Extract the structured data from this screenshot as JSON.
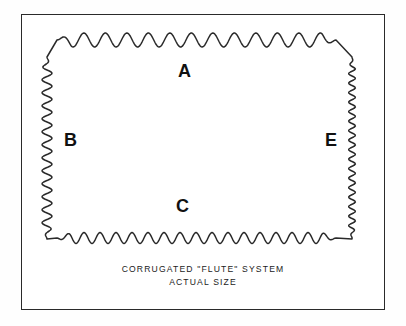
{
  "figure": {
    "stroke_color": "#2a2a2a",
    "background_color": "#ffffff",
    "frame": {
      "x": 21,
      "y": 14,
      "width": 364,
      "height": 296,
      "border_color": "#2a2a2a",
      "border_width_px": 1.4
    },
    "labels": [
      {
        "id": "A",
        "text": "A",
        "edge": "top",
        "flute": "A-flute",
        "x": 178,
        "y": 62
      },
      {
        "id": "B",
        "text": "B",
        "edge": "left",
        "flute": "B-flute",
        "x": 64,
        "y": 131
      },
      {
        "id": "C",
        "text": "C",
        "edge": "bottom",
        "flute": "C-flute",
        "x": 176,
        "y": 197
      },
      {
        "id": "E",
        "text": "E",
        "edge": "right",
        "flute": "E-flute",
        "x": 325,
        "y": 131
      }
    ],
    "caption": {
      "line1": "CORRUGATED \"FLUTE\" SYSTEM",
      "line2": "ACTUAL SIZE"
    }
  },
  "chart_data": {
    "type": "line",
    "title": "CORRUGATED \"FLUTE\" SYSTEM",
    "subtitle": "ACTUAL SIZE",
    "xlabel": "",
    "ylabel": "",
    "grid": false,
    "legend_position": "inline-edge-labels",
    "series": [
      {
        "name": "A",
        "edge": "top",
        "waveform": "sine",
        "period_px": 21.5,
        "amplitude_px": 7.0,
        "cycles": 13,
        "x_start": 57,
        "x_end": 336,
        "baseline_y": 40
      },
      {
        "name": "B",
        "edge": "left",
        "waveform": "sine",
        "period_px": 13.0,
        "amplitude_px": 5.0,
        "cycles": 14,
        "y_start": 57,
        "y_end": 239,
        "baseline_x": 47
      },
      {
        "name": "C",
        "edge": "bottom",
        "waveform": "sine",
        "period_px": 16.0,
        "amplitude_px": 5.5,
        "cycles": 17,
        "x_start": 57,
        "x_end": 336,
        "baseline_y": 238
      },
      {
        "name": "E",
        "edge": "right",
        "waveform": "sine",
        "period_px": 9.5,
        "amplitude_px": 3.4,
        "cycles": 19,
        "y_start": 57,
        "y_end": 239,
        "baseline_x": 352
      }
    ]
  }
}
